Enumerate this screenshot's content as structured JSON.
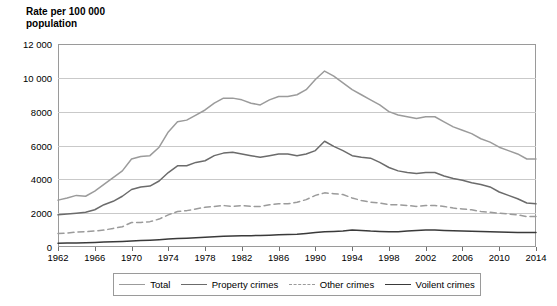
{
  "axis": {
    "y_title": "Rate per 100 000\npopulation",
    "y_ticks": [
      "12 000",
      "10 000",
      "8000",
      "6000",
      "4000",
      "2000",
      "0"
    ],
    "x_ticks": [
      "1962",
      "1966",
      "1970",
      "1974",
      "1978",
      "1982",
      "1986",
      "1990",
      "1994",
      "1998",
      "2002",
      "2006",
      "2010",
      "2014"
    ]
  },
  "legend": {
    "items": [
      {
        "label": "Total",
        "color": "#9b9b9b",
        "dash": false
      },
      {
        "label": "Property crimes",
        "color": "#6b6b6b",
        "dash": false
      },
      {
        "label": "Other crimes",
        "color": "#9b9b9b",
        "dash": true
      },
      {
        "label": "Voilent crimes",
        "color": "#3a3a3a",
        "dash": false
      }
    ]
  },
  "chart_data": {
    "type": "line",
    "title": "",
    "xlabel": "",
    "ylabel": "Rate per 100 000 population",
    "xlim": [
      1962,
      2014
    ],
    "ylim": [
      0,
      12000
    ],
    "grid": true,
    "legend_position": "bottom",
    "x": [
      1962,
      1963,
      1964,
      1965,
      1966,
      1967,
      1968,
      1969,
      1970,
      1971,
      1972,
      1973,
      1974,
      1975,
      1976,
      1977,
      1978,
      1979,
      1980,
      1981,
      1982,
      1983,
      1984,
      1985,
      1986,
      1987,
      1988,
      1989,
      1990,
      1991,
      1992,
      1993,
      1994,
      1995,
      1996,
      1997,
      1998,
      1999,
      2000,
      2001,
      2002,
      2003,
      2004,
      2005,
      2006,
      2007,
      2008,
      2009,
      2010,
      2011,
      2012,
      2013,
      2014
    ],
    "series": [
      {
        "name": "Total",
        "color": "#9b9b9b",
        "dash": false,
        "values": [
          2771,
          2900,
          3050,
          3000,
          3300,
          3700,
          4100,
          4500,
          5200,
          5350,
          5400,
          5900,
          6800,
          7400,
          7500,
          7800,
          8100,
          8500,
          8800,
          8800,
          8700,
          8500,
          8400,
          8700,
          8900,
          8900,
          9000,
          9300,
          9900,
          10400,
          10100,
          9700,
          9300,
          9000,
          8700,
          8400,
          8000,
          7800,
          7700,
          7600,
          7700,
          7700,
          7400,
          7100,
          6900,
          6700,
          6400,
          6200,
          5900,
          5700,
          5500,
          5200,
          5200
        ]
      },
      {
        "name": "Property crimes",
        "color": "#6b6b6b",
        "dash": false,
        "values": [
          1900,
          1950,
          2000,
          2050,
          2200,
          2500,
          2700,
          3000,
          3400,
          3550,
          3600,
          3900,
          4400,
          4800,
          4800,
          5000,
          5100,
          5400,
          5550,
          5600,
          5500,
          5400,
          5300,
          5400,
          5500,
          5500,
          5400,
          5500,
          5700,
          6250,
          5950,
          5700,
          5400,
          5300,
          5250,
          5000,
          4700,
          4500,
          4400,
          4350,
          4400,
          4400,
          4200,
          4050,
          3950,
          3800,
          3700,
          3550,
          3250,
          3050,
          2850,
          2600,
          2550
        ]
      },
      {
        "name": "Other crimes",
        "color": "#9b9b9b",
        "dash": true,
        "values": [
          800,
          830,
          880,
          900,
          950,
          1000,
          1100,
          1200,
          1450,
          1450,
          1500,
          1650,
          1900,
          2100,
          2150,
          2250,
          2350,
          2400,
          2450,
          2400,
          2450,
          2400,
          2400,
          2500,
          2550,
          2550,
          2650,
          2800,
          3050,
          3200,
          3150,
          3100,
          2900,
          2750,
          2650,
          2600,
          2500,
          2500,
          2450,
          2400,
          2450,
          2450,
          2400,
          2300,
          2250,
          2200,
          2100,
          2050,
          2000,
          1950,
          1900,
          1800,
          1800
        ]
      },
      {
        "name": "Voilent crimes",
        "color": "#3a3a3a",
        "dash": false,
        "values": [
          220,
          230,
          240,
          250,
          270,
          290,
          310,
          330,
          360,
          380,
          400,
          430,
          470,
          500,
          520,
          540,
          570,
          600,
          630,
          650,
          670,
          670,
          680,
          700,
          720,
          740,
          760,
          800,
          850,
          900,
          920,
          950,
          1000,
          980,
          940,
          920,
          900,
          900,
          950,
          980,
          1000,
          1000,
          980,
          960,
          950,
          930,
          920,
          900,
          880,
          870,
          860,
          850,
          850
        ]
      }
    ]
  }
}
